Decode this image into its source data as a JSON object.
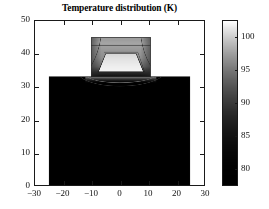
{
  "figure": {
    "width": 269,
    "height": 209,
    "background": "#ffffff",
    "axes_color": "#1a1a1a"
  },
  "title": "Temperature distribution (K)",
  "chart_data": {
    "type": "heatmap",
    "title": "Temperature distribution (K)",
    "subtitle": "",
    "xlabel": "",
    "ylabel": "",
    "colormap": "gray",
    "grid": false,
    "legend_position": "right",
    "xlim": [
      -30,
      30
    ],
    "ylim": [
      0,
      50
    ],
    "xticks": [
      -30,
      -20,
      -10,
      0,
      10,
      20,
      30
    ],
    "xticklabels": [
      "-30",
      "-20",
      "-10",
      "0",
      "10",
      "20",
      "30"
    ],
    "yticks": [
      0,
      10,
      20,
      30,
      40,
      50
    ],
    "yticklabels": [
      "0",
      "10",
      "20",
      "30",
      "40",
      "50"
    ],
    "colorbar": {
      "label": "",
      "vmin": 77.5,
      "vmax": 102.5,
      "ticks": [
        80,
        85,
        90,
        95,
        100
      ],
      "ticklabels": [
        "80",
        "85",
        "90",
        "95",
        "100"
      ],
      "low_color": "#000000",
      "high_color": "#ffffff"
    },
    "regions": [
      {
        "name": "substrate-block",
        "description": "Large uniform cold base block",
        "x_range": [
          -25,
          25
        ],
        "y_range": [
          0,
          33
        ],
        "value": 78,
        "fill": "#000000"
      },
      {
        "name": "raised-device-block",
        "description": "Raised warmer block on top of substrate",
        "x_range": [
          -10,
          11
        ],
        "y_range": [
          33,
          45
        ],
        "value_range": [
          88,
          98
        ],
        "fill": "#9a9a9a"
      },
      {
        "name": "inner-hot-core",
        "description": "Bright trapezoidal hot core inside raised block",
        "x_range": [
          -7.5,
          8.5
        ],
        "y_range": [
          34.5,
          40
        ],
        "value_range": [
          99,
          102
        ],
        "fill": "#e8e8e8"
      },
      {
        "name": "background",
        "description": "Ambient region outside the solid",
        "value": null,
        "fill": "#ffffff"
      }
    ],
    "contour_levels": [
      80,
      85,
      90,
      95,
      100
    ],
    "annotations": []
  }
}
